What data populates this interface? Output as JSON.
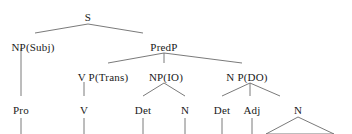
{
  "diagram": {
    "type": "syntax-tree",
    "width": 352,
    "height": 134,
    "background_color": "#ffffff",
    "line_color": "#6b6b6b",
    "text_color": "#1a1a1a",
    "clipped_at_bottom": true,
    "partial_top_row": "",
    "nodes": [
      {
        "id": "s",
        "label": "S",
        "x": 88,
        "y": 12,
        "font_size": 11
      },
      {
        "id": "np_subj",
        "label": "NP(Subj)",
        "x": 33,
        "y": 42,
        "font_size": 11
      },
      {
        "id": "predp",
        "label": "PredP",
        "x": 164,
        "y": 42,
        "font_size": 11
      },
      {
        "id": "vp_trans",
        "label": "V P(Trans)",
        "x": 103,
        "y": 72,
        "font_size": 11
      },
      {
        "id": "np_io",
        "label": "NP(IO)",
        "x": 166,
        "y": 72,
        "font_size": 11
      },
      {
        "id": "np_do",
        "label": "N P(DO)",
        "x": 247,
        "y": 72,
        "font_size": 11
      },
      {
        "id": "pro",
        "label": "Pro",
        "x": 21,
        "y": 105,
        "font_size": 11
      },
      {
        "id": "v",
        "label": "V",
        "x": 84,
        "y": 105,
        "font_size": 11
      },
      {
        "id": "det1",
        "label": "Det",
        "x": 143,
        "y": 105,
        "font_size": 11
      },
      {
        "id": "n1",
        "label": "N",
        "x": 185,
        "y": 105,
        "font_size": 11
      },
      {
        "id": "det2",
        "label": "Det",
        "x": 222,
        "y": 105,
        "font_size": 11
      },
      {
        "id": "adj",
        "label": "Adj",
        "x": 252,
        "y": 105,
        "font_size": 11
      },
      {
        "id": "n2",
        "label": "N",
        "x": 298,
        "y": 105,
        "font_size": 11
      }
    ],
    "edges": [
      {
        "from": "s",
        "to": "np_subj",
        "x1": 88,
        "y1": 24,
        "x2": 35,
        "y2": 33
      },
      {
        "from": "s",
        "to": "predp",
        "x1": 88,
        "y1": 24,
        "x2": 143,
        "y2": 33
      },
      {
        "from": "np_subj",
        "to": "pro",
        "x1": 21,
        "y1": 48,
        "x2": 21,
        "y2": 96
      },
      {
        "from": "predp",
        "to": "vp_trans",
        "x1": 164,
        "y1": 53,
        "x2": 108,
        "y2": 63
      },
      {
        "from": "predp",
        "to": "np_io",
        "x1": 164,
        "y1": 53,
        "x2": 164,
        "y2": 63
      },
      {
        "from": "predp",
        "to": "np_do",
        "x1": 164,
        "y1": 53,
        "x2": 242,
        "y2": 63
      },
      {
        "from": "vp_trans",
        "to": "v",
        "x1": 84,
        "y1": 82,
        "x2": 84,
        "y2": 96
      },
      {
        "from": "np_io",
        "to": "det1",
        "x1": 164,
        "y1": 83,
        "x2": 143,
        "y2": 96
      },
      {
        "from": "np_io",
        "to": "n1",
        "x1": 164,
        "y1": 83,
        "x2": 185,
        "y2": 96
      },
      {
        "from": "np_do",
        "to": "det2",
        "x1": 250,
        "y1": 83,
        "x2": 222,
        "y2": 96
      },
      {
        "from": "np_do",
        "to": "adj",
        "x1": 250,
        "y1": 83,
        "x2": 250,
        "y2": 96
      },
      {
        "from": "np_do",
        "to": "n2",
        "x1": 250,
        "y1": 83,
        "x2": 280,
        "y2": 96
      },
      {
        "from": "pro",
        "to": "word1",
        "x1": 21,
        "y1": 118,
        "x2": 21,
        "y2": 134
      },
      {
        "from": "v",
        "to": "word2",
        "x1": 84,
        "y1": 118,
        "x2": 84,
        "y2": 134
      },
      {
        "from": "det1",
        "to": "word3",
        "x1": 143,
        "y1": 118,
        "x2": 143,
        "y2": 134
      },
      {
        "from": "n1",
        "to": "word4",
        "x1": 185,
        "y1": 118,
        "x2": 185,
        "y2": 134
      },
      {
        "from": "det2",
        "to": "word5",
        "x1": 222,
        "y1": 118,
        "x2": 222,
        "y2": 134
      },
      {
        "from": "adj",
        "to": "word6",
        "x1": 252,
        "y1": 118,
        "x2": 252,
        "y2": 134
      }
    ],
    "triangles": [
      {
        "id": "n2-triangle",
        "parent": "n2",
        "apex_x": 298,
        "apex_y": 117,
        "left_x": 266,
        "right_x": 334,
        "base_y": 134
      }
    ]
  }
}
